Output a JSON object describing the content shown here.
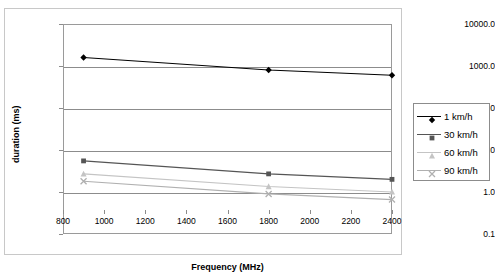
{
  "chart_data": {
    "type": "line",
    "title": "",
    "xlabel": "Frequency (MHz)",
    "ylabel": "duration (ms)",
    "x": [
      900,
      1800,
      2400
    ],
    "xlim": [
      800,
      2400
    ],
    "ylim": [
      0.1,
      10000.0
    ],
    "yscale": "log",
    "grid": true,
    "legend_position": "right",
    "xticks": [
      "800",
      "1000",
      "1200",
      "1400",
      "1600",
      "1800",
      "2000",
      "2200",
      "2400"
    ],
    "xtick_values": [
      800,
      1000,
      1200,
      1400,
      1600,
      1800,
      2000,
      2200,
      2400
    ],
    "yticks": [
      "0.1",
      "1.0",
      "10.0",
      "100.0",
      "1000.0",
      "10000.0"
    ],
    "ytick_values": [
      0.1,
      1.0,
      10.0,
      100.0,
      1000.0,
      10000.0
    ],
    "series": [
      {
        "name": "1 km/h",
        "values": [
          1600,
          800,
          600
        ],
        "color": "#000000",
        "marker": "diamond"
      },
      {
        "name": "30 km/h",
        "values": [
          5.5,
          2.7,
          2.0
        ],
        "color": "#555555",
        "marker": "square"
      },
      {
        "name": "60 km/h",
        "values": [
          2.7,
          1.35,
          1.0
        ],
        "color": "#c4c4c4",
        "marker": "triangle"
      },
      {
        "name": "90 km/h",
        "values": [
          1.8,
          0.9,
          0.66
        ],
        "color": "#b0b0b0",
        "marker": "cross"
      }
    ]
  },
  "legend": {
    "entries": [
      {
        "label": "1 km/h"
      },
      {
        "label": "30 km/h"
      },
      {
        "label": "60 km/h"
      },
      {
        "label": "90 km/h"
      }
    ]
  }
}
